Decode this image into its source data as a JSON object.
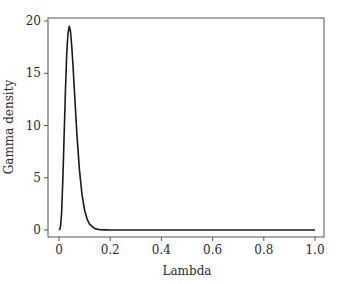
{
  "chart_data": {
    "type": "line",
    "title": "",
    "xlabel": "Lambda",
    "ylabel": "Gamma density",
    "xlim": [
      0,
      1.0
    ],
    "ylim": [
      0,
      20
    ],
    "xticks": [
      0,
      0.2,
      0.4,
      0.6,
      0.8,
      1.0
    ],
    "xtick_labels": [
      "0",
      "0.2",
      "0.4",
      "0.6",
      "0.8",
      "1.0"
    ],
    "yticks": [
      0,
      5,
      10,
      15,
      20
    ],
    "ytick_labels": [
      "0",
      "5",
      "10",
      "15",
      "20"
    ],
    "grid": false,
    "legend": null,
    "series": [
      {
        "name": "Gamma density",
        "color": "#1a1a1a",
        "x": [
          0.0,
          0.005,
          0.01,
          0.015,
          0.02,
          0.025,
          0.03,
          0.035,
          0.04,
          0.045,
          0.05,
          0.055,
          0.06,
          0.07,
          0.08,
          0.09,
          0.1,
          0.11,
          0.12,
          0.14,
          0.16,
          0.18,
          0.2,
          0.3,
          0.4,
          0.5,
          0.6,
          0.7,
          0.8,
          0.9,
          1.0
        ],
        "y": [
          0.0,
          0.16,
          1.53,
          4.8,
          9.02,
          13.2,
          16.8,
          18.8,
          19.5,
          19.0,
          17.5,
          15.6,
          13.4,
          9.13,
          5.73,
          3.37,
          1.89,
          1.02,
          0.53,
          0.13,
          0.03,
          0.01,
          0.0,
          0.0,
          0.0,
          0.0,
          0.0,
          0.0,
          0.0,
          0.0,
          0.0
        ]
      }
    ]
  }
}
